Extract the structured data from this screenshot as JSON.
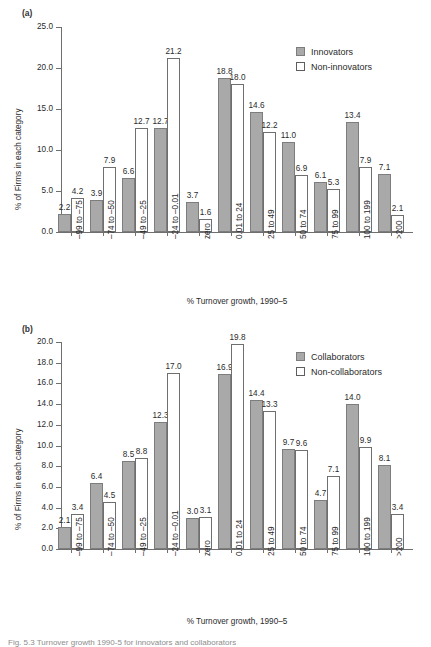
{
  "figure": {
    "caption_fragment": "Fig. 5.3  Turnover growth 1990-5 for innovators and collaborators"
  },
  "panels": [
    {
      "tag": "(a)",
      "legend": [
        {
          "key": "innovators",
          "label": "Innovators",
          "style": "solid"
        },
        {
          "key": "non-innovators",
          "label": "Non-innovators",
          "style": "open"
        }
      ],
      "chart_data": {
        "type": "bar",
        "title": "",
        "xlabel": "% Turnover growth, 1990–5",
        "ylabel": "% of Firms in each category",
        "ylim": [
          0,
          25
        ],
        "ytick_step": 5,
        "yticks": [
          "0.0",
          "5.0",
          "10.0",
          "15.0",
          "20.0",
          "25.0"
        ],
        "grid": false,
        "legend_position": "top-right",
        "categories": [
          "–99 to –75",
          "–74 to –50",
          "–49 to –25",
          "–24 to –0.01",
          "zero",
          "0.01 to 24",
          "25 to 49",
          "50 to 74",
          "75 to 99",
          "100 to 199",
          ">200"
        ],
        "series": [
          {
            "name": "Innovators",
            "style": "solid",
            "values": [
              2.2,
              3.9,
              6.6,
              12.7,
              3.7,
              18.8,
              14.6,
              11.0,
              6.1,
              13.4,
              7.1
            ]
          },
          {
            "name": "Non-innovators",
            "style": "open",
            "values": [
              4.2,
              7.9,
              12.7,
              21.2,
              1.6,
              18.0,
              12.2,
              6.9,
              5.3,
              7.9,
              2.1
            ]
          }
        ]
      }
    },
    {
      "tag": "(b)",
      "legend": [
        {
          "key": "collaborators",
          "label": "Collaborators",
          "style": "solid"
        },
        {
          "key": "non-collaborators",
          "label": "Non-collaborators",
          "style": "open"
        }
      ],
      "chart_data": {
        "type": "bar",
        "title": "",
        "xlabel": "% Turnover growth, 1990–5",
        "ylabel": "% of Firms in each category",
        "ylim": [
          0,
          20
        ],
        "ytick_step": 2,
        "yticks": [
          "0.0",
          "2.0",
          "4.0",
          "6.0",
          "8.0",
          "10.0",
          "12.0",
          "14.0",
          "16.0",
          "18.0",
          "20.0"
        ],
        "grid": false,
        "legend_position": "top-right",
        "categories": [
          "–99 to –75",
          "–74 to –50",
          "–49 to –25",
          "–24 to –0.01",
          "zero",
          "0.01 to 24",
          "25 to 49",
          "50 to 74",
          "75 to 99",
          "100 to 199",
          ">200"
        ],
        "series": [
          {
            "name": "Collaborators",
            "style": "solid",
            "values": [
              2.1,
              6.4,
              8.5,
              12.3,
              3.0,
              16.9,
              14.4,
              9.7,
              4.7,
              14.0,
              8.1
            ]
          },
          {
            "name": "Non-collaborators",
            "style": "open",
            "values": [
              3.4,
              4.5,
              8.8,
              17.0,
              3.1,
              19.8,
              13.3,
              9.6,
              7.1,
              9.9,
              3.4
            ]
          }
        ]
      }
    }
  ]
}
